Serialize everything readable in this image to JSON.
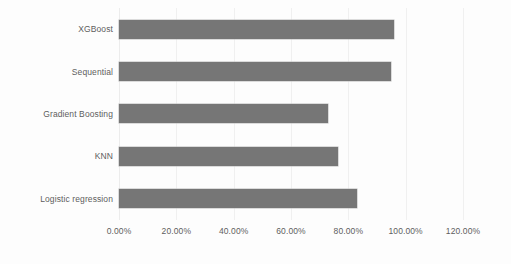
{
  "chart_data": {
    "type": "bar",
    "orientation": "horizontal",
    "title": "",
    "xlabel": "",
    "ylabel": "",
    "categories": [
      "XGBoost",
      "Sequential",
      "Gradient Boosting",
      "KNN",
      "Logistic regression"
    ],
    "values": [
      96.0,
      95.0,
      73.0,
      76.5,
      83.0
    ],
    "value_format": "percent",
    "xlim": [
      0,
      120
    ],
    "xticks": [
      0,
      20,
      40,
      60,
      80,
      100,
      120
    ],
    "xtick_labels": [
      "0.00%",
      "20.00%",
      "40.00%",
      "60.00%",
      "80.00%",
      "100.00%",
      "120.00%"
    ],
    "grid": true,
    "grid_axis": "x",
    "legend": false,
    "legend_position": "none",
    "series": [
      {
        "name": "Accuracy",
        "color": "#767676",
        "values": [
          96.0,
          95.0,
          73.0,
          76.5,
          83.0
        ]
      }
    ]
  },
  "style": {
    "bar_color": "#767676",
    "bar_border_color": "#b9b9b9",
    "gridline_color": "#f0f0f0",
    "axis_color": "#ececec",
    "text_color": "#5d5d5d",
    "background": "#fdfdfd"
  }
}
